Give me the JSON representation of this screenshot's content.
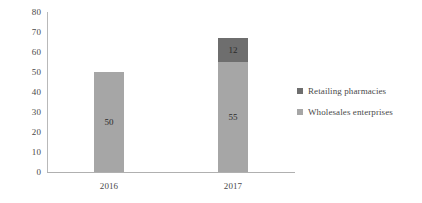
{
  "chart_data": {
    "type": "bar",
    "subtype": "stacked-vertical",
    "title": "",
    "xlabel": "",
    "ylabel": "",
    "categories": [
      "2016",
      "2017"
    ],
    "series": [
      {
        "name": "Wholesales enterprises",
        "values": [
          50,
          55
        ],
        "color": "#a6a6a6",
        "labels": [
          "50",
          "55"
        ]
      },
      {
        "name": "Retailing pharmacies",
        "values": [
          null,
          12
        ],
        "color": "#6e6e6e",
        "labels": [
          "",
          "12"
        ]
      }
    ],
    "totals": [
      50,
      67
    ],
    "ylim": [
      0,
      80
    ],
    "yticks": [
      "0",
      "10",
      "20",
      "30",
      "40",
      "50",
      "60",
      "70",
      "80"
    ],
    "ytick_values": [
      0,
      10,
      20,
      30,
      40,
      50,
      60,
      70,
      80
    ],
    "grid": false,
    "legend_position": "right",
    "legend": [
      {
        "label": "Retailing pharmacies",
        "color": "#6e6e6e"
      },
      {
        "label": "Wholesales enterprises",
        "color": "#a6a6a6"
      }
    ],
    "axis_color": "#b0b0b0",
    "background": "#ffffff"
  }
}
